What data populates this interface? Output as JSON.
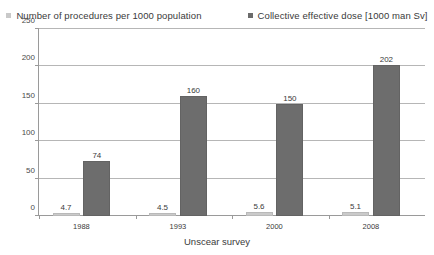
{
  "chart_data": {
    "type": "bar",
    "title": "",
    "xlabel": "Unscear survey",
    "ylabel": "",
    "categories": [
      "1988",
      "1993",
      "2000",
      "2008"
    ],
    "ylim": [
      0,
      250
    ],
    "yticks": [
      0,
      50,
      100,
      150,
      200,
      250
    ],
    "grid": true,
    "legend_position": "top",
    "series": [
      {
        "name": "Number of procedures per 1000 population",
        "color": "#cacaca",
        "values": [
          4.7,
          4.5,
          5.6,
          5.1
        ],
        "labels": [
          "4.7",
          "4.5",
          "5.6",
          "5.1"
        ]
      },
      {
        "name": "Collective effective dose [1000 man Sv]",
        "color": "#6d6d6d",
        "values": [
          74,
          160,
          150,
          202
        ],
        "labels": [
          "74",
          "160",
          "150",
          "202"
        ]
      }
    ]
  }
}
